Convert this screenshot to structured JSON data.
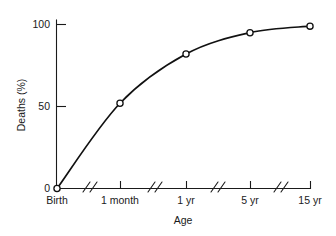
{
  "chart_data": {
    "type": "line",
    "title": "",
    "subtitle": "",
    "xlabel": "Age",
    "ylabel": "Deaths (%)",
    "categories": [
      "Birth",
      "1 month",
      "1 yr",
      "5 yr",
      "15 yr"
    ],
    "values": [
      0,
      52,
      82,
      95,
      99
    ],
    "series": [
      {
        "name": "Cumulative deaths",
        "values": [
          0,
          52,
          82,
          95,
          99
        ]
      }
    ],
    "ylim": [
      0,
      100
    ],
    "y_ticks": [
      0,
      50,
      100
    ],
    "y_tick_labels": [
      "0",
      "50",
      "100"
    ],
    "x_tick_labels": [
      "Birth",
      "1 month",
      "1 yr",
      "5 yr",
      "15 yr"
    ],
    "grid": false,
    "legend": "none",
    "axis_breaks": 4,
    "marker": "open-circle",
    "line_color": "#111111",
    "marker_fill": "#ffffff",
    "background_color": "#ffffff",
    "axis_color": "#1a1a1a"
  },
  "axes": {
    "y_title": "Deaths (%)",
    "x_title": "Age",
    "y_labels": [
      {
        "text": "100",
        "value": 100
      },
      {
        "text": "50",
        "value": 50
      },
      {
        "text": "0",
        "value": 0
      }
    ],
    "x_labels": [
      {
        "text": "Birth"
      },
      {
        "text": "1 month"
      },
      {
        "text": "1 yr"
      },
      {
        "text": "5 yr"
      },
      {
        "text": "15 yr"
      }
    ]
  }
}
